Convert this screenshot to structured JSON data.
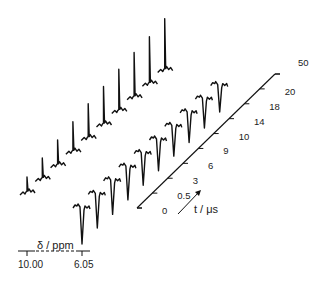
{
  "chart_data": {
    "type": "line",
    "title": "",
    "subtitle": "Stacked NMR spectra vs. delay time",
    "xlabel": "δ / ppm",
    "zlabel": "t / μs",
    "x_ticks": [
      "10.00",
      "6.05"
    ],
    "z_ticks": [
      "0",
      "0.5",
      "3",
      "6",
      "9",
      "10",
      "14",
      "18",
      "20",
      "50"
    ],
    "series": [
      {
        "name": "peak at 10.00 ppm (positive, relative intensity)",
        "x": [
          0,
          0.5,
          3,
          6,
          9,
          10,
          14,
          18,
          20,
          50
        ],
        "values": [
          0.4,
          0.52,
          0.62,
          0.72,
          0.82,
          0.9,
          0.98,
          1.05,
          1.1,
          1.2
        ]
      },
      {
        "name": "peak at 6.05 ppm (inverted, relative intensity)",
        "x": [
          0,
          0.5,
          3,
          6,
          9,
          10,
          14,
          18,
          20,
          50
        ],
        "values": [
          -0.75,
          -0.7,
          -0.7,
          -0.68,
          -0.66,
          -0.64,
          -0.62,
          -0.62,
          -0.6,
          -0.55
        ]
      }
    ],
    "grid": false,
    "legend": "none"
  },
  "labels": {
    "ppm_axis": "δ / ppm",
    "ppm_left": "10.00",
    "ppm_right": "6.05",
    "t_axis": "t / μs"
  }
}
